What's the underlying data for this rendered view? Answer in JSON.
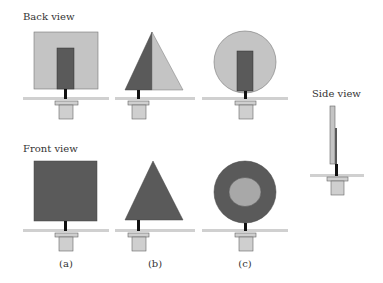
{
  "labels": {
    "back_view": "Back view",
    "front_view": "Front view",
    "side_view": "Side view"
  },
  "captions": [
    "(a)",
    "(b)",
    "(c)"
  ],
  "figures": [
    {
      "id": "a",
      "shape": "square",
      "back": "light square with dark vertical bar",
      "front": "dark square"
    },
    {
      "id": "b",
      "shape": "triangle",
      "back": "triangle split dark left / light right",
      "front": "dark triangle"
    },
    {
      "id": "c",
      "shape": "circle",
      "back": "light circle with dark vertical bar",
      "front": "dark circle with light inner disc"
    }
  ],
  "colors": {
    "light_fill": "#c4c4c4",
    "dark_fill": "#5a5a5a",
    "stem": "#111111",
    "ground": "#d0d0d0",
    "mount_fill": "#cfcfcf",
    "outline": "#555555"
  }
}
